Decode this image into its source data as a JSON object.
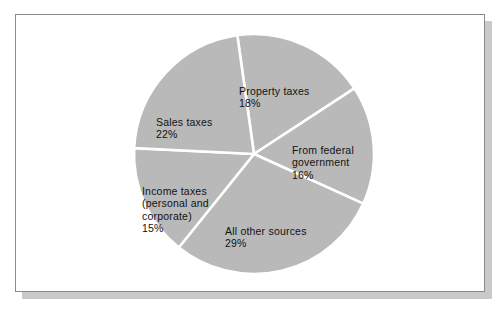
{
  "figure": {
    "background_color": "#ffffff",
    "frame_border_color": "#8a8a8a",
    "shadow_color": "#c9c9c9"
  },
  "chart_data": {
    "type": "pie",
    "title": "",
    "subtitle": "",
    "xlabel": "",
    "ylabel": "",
    "legend_position": "none",
    "grid": false,
    "units": "percent",
    "total": 100,
    "slice_color": "#b9b9b9",
    "separator_color": "#ffffff",
    "categories": [
      "Property taxes",
      "From federal government",
      "All other sources",
      "Income taxes (personal and corporate)",
      "Sales taxes"
    ],
    "values": [
      18,
      16,
      29,
      15,
      22
    ],
    "slices": [
      {
        "name": "property-taxes",
        "label": "Property taxes",
        "label_lines": [
          "Property taxes"
        ],
        "percent_text": "18%",
        "value": 18,
        "start_angle_deg": 352,
        "end_angle_deg": 56.8,
        "color": "#b9b9b9"
      },
      {
        "name": "from-federal-government",
        "label": "From federal government",
        "label_lines": [
          "From federal",
          "government"
        ],
        "percent_text": "16%",
        "value": 16,
        "start_angle_deg": 56.8,
        "end_angle_deg": 114.4,
        "color": "#b9b9b9"
      },
      {
        "name": "all-other-sources",
        "label": "All other sources",
        "label_lines": [
          "All other sources"
        ],
        "percent_text": "29%",
        "value": 29,
        "start_angle_deg": 114.4,
        "end_angle_deg": 218.8,
        "color": "#b9b9b9"
      },
      {
        "name": "income-taxes",
        "label": "Income taxes (personal and corporate)",
        "label_lines": [
          "Income taxes",
          "(personal and",
          "corporate)"
        ],
        "percent_text": "15%",
        "value": 15,
        "start_angle_deg": 218.8,
        "end_angle_deg": 272.8,
        "color": "#b9b9b9"
      },
      {
        "name": "sales-taxes",
        "label": "Sales taxes",
        "label_lines": [
          "Sales taxes"
        ],
        "percent_text": "22%",
        "value": 22,
        "start_angle_deg": 272.8,
        "end_angle_deg": 352,
        "color": "#b9b9b9"
      }
    ]
  },
  "labels": {
    "property": {
      "text": "Property taxes",
      "percent": "18%"
    },
    "federal": {
      "text": "From federal\ngovernment",
      "percent": "16%"
    },
    "other": {
      "text": "All other sources",
      "percent": "29%"
    },
    "income": {
      "text": "Income taxes\n(personal and\ncorporate)",
      "percent": "15%"
    },
    "sales": {
      "text": "Sales taxes",
      "percent": "22%"
    }
  }
}
